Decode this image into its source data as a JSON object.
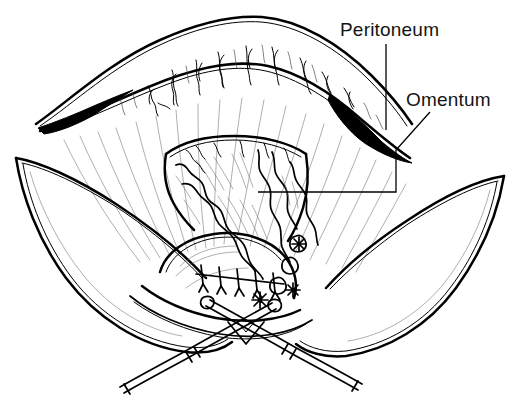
{
  "figure": {
    "kind": "medical-line-illustration",
    "background_color": "#ffffff",
    "ink_color": "#000000",
    "width": 519,
    "height": 403
  },
  "labels": [
    {
      "id": "peritoneum",
      "text": "Peritoneum",
      "x": 340,
      "y": 36,
      "leader": "vertical line descending from label to peritoneal fold"
    },
    {
      "id": "omentum",
      "text": "Omentum",
      "x": 406,
      "y": 106,
      "leader": "diagonal then horizontal line running left to omental mass"
    }
  ],
  "regions": [
    {
      "id": "peritoneal-arch",
      "name": "Peritoneum arched fold with vessels"
    },
    {
      "id": "mesentery-fan",
      "name": "Radiating peritoneal fan lines"
    },
    {
      "id": "omental-mass",
      "name": "Omentum lobulated fatty mass"
    },
    {
      "id": "left-flap",
      "name": "Left retracted abdominal wall flap"
    },
    {
      "id": "right-flap",
      "name": "Right retracted abdominal wall flap"
    },
    {
      "id": "pelvic-organ",
      "name": "Pelvic organ with suture repair"
    },
    {
      "id": "suture-line",
      "name": "Interrupted suture line with knots"
    },
    {
      "id": "instrument-left",
      "name": "Surgical clamp crossing left to right"
    },
    {
      "id": "instrument-right",
      "name": "Surgical clamp crossing right to left"
    }
  ]
}
